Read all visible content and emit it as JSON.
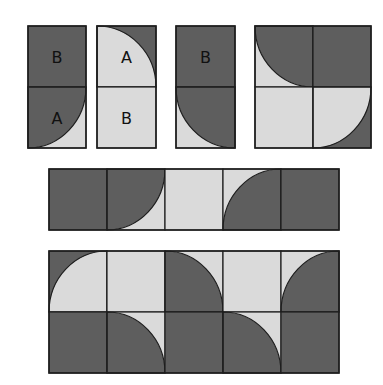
{
  "colors": {
    "dark": "#5e5e5e",
    "light": "#dadada",
    "line": "#1e1e1e",
    "background": "#ffffff"
  },
  "panels": [
    {
      "id": "tile-1",
      "x": 27,
      "y": 25,
      "cols": 1,
      "rows": 2,
      "cw": 58,
      "ch": 61,
      "cells": [
        {
          "type": "D",
          "label": "B"
        },
        {
          "type": "dq-tl",
          "label": "A"
        }
      ]
    },
    {
      "id": "tile-2",
      "x": 96,
      "y": 25,
      "cols": 1,
      "rows": 2,
      "cw": 59,
      "ch": 61,
      "cells": [
        {
          "type": "lq-bl",
          "label": "A"
        },
        {
          "type": "L",
          "label": "B"
        }
      ]
    },
    {
      "id": "tile-3",
      "x": 175,
      "y": 25,
      "cols": 1,
      "rows": 2,
      "cw": 59,
      "ch": 61,
      "cells": [
        {
          "type": "D",
          "label": "B"
        },
        {
          "type": "dq-tr",
          "label": ""
        }
      ]
    },
    {
      "id": "tile-4",
      "x": 254,
      "y": 25,
      "cols": 2,
      "rows": 2,
      "cw": 58,
      "ch": 61,
      "cells": [
        {
          "type": "dq-tr"
        },
        {
          "type": "D"
        },
        {
          "type": "L"
        },
        {
          "type": "lq-tl"
        }
      ]
    },
    {
      "id": "row-2",
      "x": 48,
      "y": 168,
      "cols": 5,
      "rows": 1,
      "cw": 58,
      "ch": 61,
      "cells": [
        {
          "type": "D"
        },
        {
          "type": "dq-tl"
        },
        {
          "type": "L"
        },
        {
          "type": "dq-br"
        },
        {
          "type": "D"
        }
      ]
    },
    {
      "id": "row-3",
      "x": 48,
      "y": 250,
      "cols": 5,
      "rows": 2,
      "cw": 58,
      "ch": 61,
      "cells": [
        {
          "type": "lq-br"
        },
        {
          "type": "L"
        },
        {
          "type": "dq-bl"
        },
        {
          "type": "L"
        },
        {
          "type": "dq-br"
        },
        {
          "type": "D"
        },
        {
          "type": "dq-bl"
        },
        {
          "type": "D"
        },
        {
          "type": "dq-bl"
        },
        {
          "type": "D"
        }
      ]
    }
  ]
}
